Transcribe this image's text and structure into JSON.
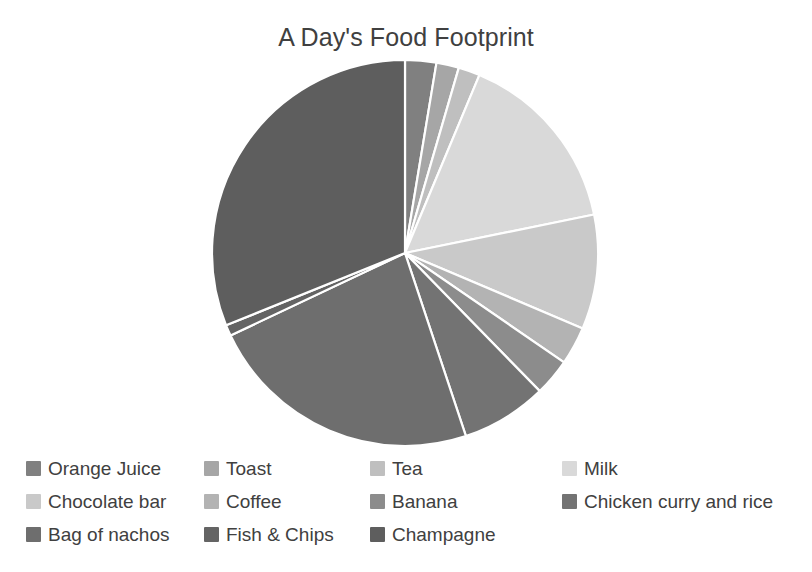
{
  "chart_data": {
    "type": "pie",
    "title": "A Day's Food Footprint",
    "xlabel": "",
    "ylabel": "",
    "legend_position": "bottom",
    "grid": false,
    "start_angle_deg": 0,
    "direction": "clockwise",
    "categories": [
      "Orange Juice",
      "Toast",
      "Tea",
      "Milk",
      "Chocolate bar",
      "Coffee",
      "Banana",
      "Chicken curry and rice",
      "Bag of nachos",
      "Fish & Chips",
      "Champagne"
    ],
    "values": [
      2.6,
      1.9,
      1.8,
      15.5,
      9.6,
      3.2,
      3.1,
      7.2,
      23.1,
      0.9,
      31.1
    ],
    "units": "percent",
    "colors": [
      "#808080",
      "#a6a6a6",
      "#bfbfbf",
      "#d9d9d9",
      "#c9c9c9",
      "#b3b3b3",
      "#8c8c8c",
      "#737373",
      "#6e6e6e",
      "#646464",
      "#5e5e5e"
    ],
    "slices": [
      {
        "label": "Orange Juice",
        "value": 2.6,
        "color": "#808080",
        "start_deg": 0.0,
        "end_deg": 9.4
      },
      {
        "label": "Toast",
        "value": 1.9,
        "color": "#a6a6a6",
        "start_deg": 9.4,
        "end_deg": 16.2
      },
      {
        "label": "Tea",
        "value": 1.8,
        "color": "#bfbfbf",
        "start_deg": 16.2,
        "end_deg": 22.7
      },
      {
        "label": "Milk",
        "value": 15.5,
        "color": "#d9d9d9",
        "start_deg": 22.7,
        "end_deg": 78.5
      },
      {
        "label": "Chocolate bar",
        "value": 9.6,
        "color": "#c9c9c9",
        "start_deg": 78.5,
        "end_deg": 113.0
      },
      {
        "label": "Coffee",
        "value": 3.2,
        "color": "#b3b3b3",
        "start_deg": 113.0,
        "end_deg": 124.5
      },
      {
        "label": "Banana",
        "value": 3.1,
        "color": "#8c8c8c",
        "start_deg": 124.5,
        "end_deg": 135.7
      },
      {
        "label": "Chicken curry and rice",
        "value": 7.2,
        "color": "#737373",
        "start_deg": 135.7,
        "end_deg": 161.6
      },
      {
        "label": "Bag of nachos",
        "value": 23.1,
        "color": "#6e6e6e",
        "start_deg": 161.6,
        "end_deg": 244.7
      },
      {
        "label": "Fish & Chips",
        "value": 0.9,
        "color": "#646464",
        "start_deg": 244.7,
        "end_deg": 248.0
      },
      {
        "label": "Champagne",
        "value": 31.1,
        "color": "#5e5e5e",
        "start_deg": 248.0,
        "end_deg": 360.0
      }
    ]
  },
  "legend": {
    "items": [
      {
        "label": "Orange Juice",
        "color": "#808080"
      },
      {
        "label": "Toast",
        "color": "#a6a6a6"
      },
      {
        "label": "Tea",
        "color": "#bfbfbf"
      },
      {
        "label": "Milk",
        "color": "#d9d9d9"
      },
      {
        "label": "Chocolate bar",
        "color": "#c9c9c9"
      },
      {
        "label": "Coffee",
        "color": "#b3b3b3"
      },
      {
        "label": "Banana",
        "color": "#8c8c8c"
      },
      {
        "label": "Chicken curry and rice",
        "color": "#737373"
      },
      {
        "label": "Bag of nachos",
        "color": "#6e6e6e"
      },
      {
        "label": "Fish & Chips",
        "color": "#646464"
      },
      {
        "label": "Champagne",
        "color": "#5e5e5e"
      }
    ]
  },
  "style": {
    "background": "#ffffff",
    "text_color": "#404040",
    "slice_border": "#ffffff"
  }
}
